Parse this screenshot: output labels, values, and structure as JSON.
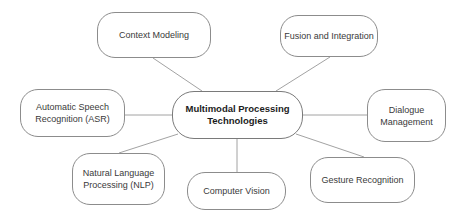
{
  "diagram": {
    "type": "mind-map",
    "center": {
      "label": "Multimodal Processing\nTechnologies"
    },
    "nodes": [
      {
        "id": "context-modeling",
        "label": "Context Modeling"
      },
      {
        "id": "fusion-integration",
        "label": "Fusion and Integration"
      },
      {
        "id": "asr",
        "label": "Automatic Speech\nRecognition (ASR)"
      },
      {
        "id": "dialogue-management",
        "label": "Dialogue\nManagement"
      },
      {
        "id": "nlp",
        "label": "Natural Language\nProcessing (NLP)"
      },
      {
        "id": "computer-vision",
        "label": "Computer Vision"
      },
      {
        "id": "gesture-recognition",
        "label": "Gesture Recognition"
      }
    ],
    "edge_color": "#8a8a8a",
    "node_border_color": "#8c8c8c"
  }
}
